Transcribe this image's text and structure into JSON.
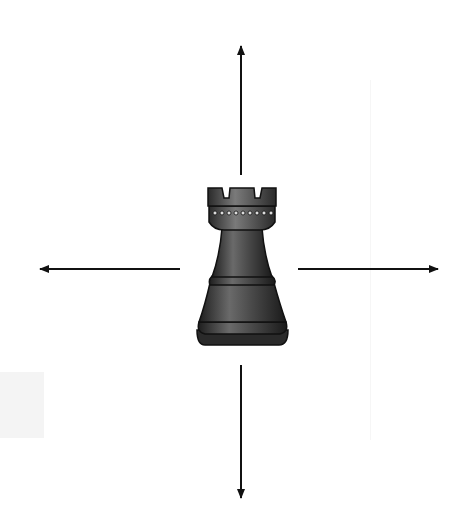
{
  "diagram": {
    "piece": {
      "name": "rook",
      "color": "#3a3a3a"
    },
    "arrows": [
      {
        "direction": "up",
        "x1": 241,
        "y1": 175,
        "x2": 241,
        "y2": 44
      },
      {
        "direction": "down",
        "x1": 241,
        "y1": 365,
        "x2": 241,
        "y2": 500
      },
      {
        "direction": "left",
        "x1": 180,
        "y1": 269,
        "x2": 38,
        "y2": 269
      },
      {
        "direction": "right",
        "x1": 298,
        "y1": 269,
        "x2": 440,
        "y2": 269
      }
    ],
    "arrow_color": "#111111"
  }
}
